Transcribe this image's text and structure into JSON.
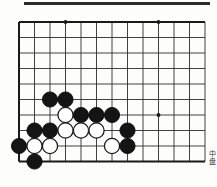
{
  "figure": {
    "type": "go-board-diagram",
    "caption": "中盘",
    "board": {
      "cols": 13,
      "rows": 10,
      "origin_x": 19,
      "origin_y": 22,
      "spacing_x": 15.5,
      "spacing_y": 15.5,
      "line_color": "#2d2d2d",
      "edge_color": "#1a1a1a",
      "background": "#fdfdfb",
      "bottom_edge_row": 9,
      "edges": {
        "left": true,
        "top": true,
        "right": false,
        "bottom": true
      },
      "star_points": [
        {
          "col": 3,
          "row": 0
        },
        {
          "col": 9,
          "row": 0
        },
        {
          "col": 9,
          "row": 6
        }
      ]
    },
    "stone_colors": {
      "black_fill": "#141414",
      "black_stroke": "#000000",
      "white_fill": "#ffffff",
      "white_stroke": "#1c1c1c"
    },
    "stone_radius": 7.6,
    "stones": [
      {
        "color": "black",
        "col": 2,
        "row": 5
      },
      {
        "color": "black",
        "col": 3,
        "row": 5
      },
      {
        "color": "white",
        "col": 3,
        "row": 6
      },
      {
        "color": "black",
        "col": 4,
        "row": 6
      },
      {
        "color": "black",
        "col": 5,
        "row": 6
      },
      {
        "color": "black",
        "col": 6,
        "row": 6
      },
      {
        "color": "black",
        "col": 1,
        "row": 7
      },
      {
        "color": "black",
        "col": 2,
        "row": 7
      },
      {
        "color": "white",
        "col": 3,
        "row": 7
      },
      {
        "color": "white",
        "col": 4,
        "row": 7
      },
      {
        "color": "white",
        "col": 5,
        "row": 7
      },
      {
        "color": "black",
        "col": 7,
        "row": 7
      },
      {
        "color": "black",
        "col": 0,
        "row": 8
      },
      {
        "color": "white",
        "col": 1,
        "row": 8
      },
      {
        "color": "white",
        "col": 2,
        "row": 8
      },
      {
        "color": "white",
        "col": 6,
        "row": 8
      },
      {
        "color": "black",
        "col": 7,
        "row": 8
      },
      {
        "color": "black",
        "col": 1,
        "row": 9
      }
    ]
  }
}
